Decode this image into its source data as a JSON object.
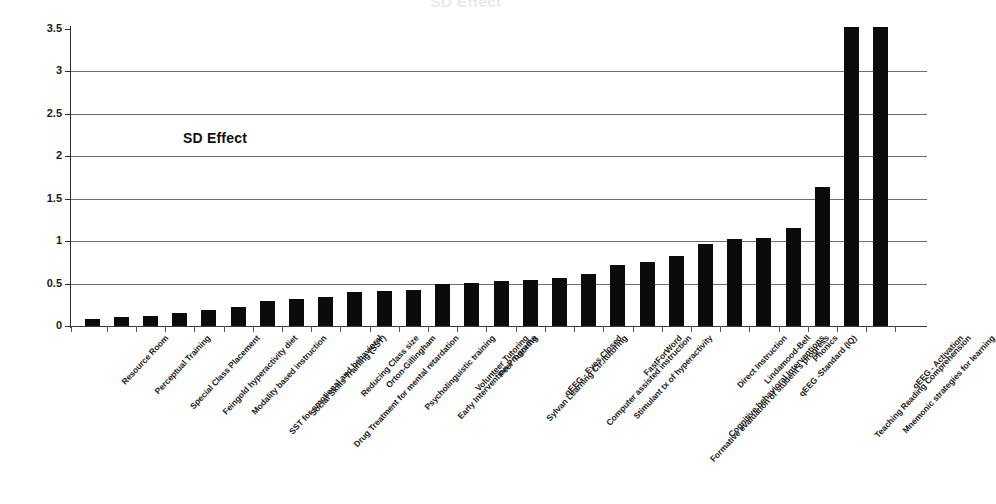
{
  "chart_data": {
    "type": "bar",
    "title": "SD Effect",
    "annotation": "SD Effect",
    "xlabel": "",
    "ylabel": "",
    "ylim": [
      0,
      3.5
    ],
    "ytick_step": 0.5,
    "ytick_labels": [
      "3.5",
      "3",
      "2.5",
      "2",
      "1.5",
      "1",
      "0.5",
      "0"
    ],
    "ytick_values": [
      3.5,
      3,
      2.5,
      2,
      1.5,
      1,
      0.5,
      0
    ],
    "grid": true,
    "legend": "none",
    "bar_color": "#0b0b0b",
    "categories": [
      "Resource Room",
      "Perceptual Training",
      "Special Class Placement",
      "Feingold hyperactivity diet",
      "Modality based instruction",
      "SST for emotional and behavioral",
      "Social Skills Training (SST)",
      "Drug Treatment for mental retardation",
      "Reducing Class size",
      "Orton-Gillingham",
      "Psycholinguistic training",
      "Early Intervention Programs",
      "Volunteer Tutoring",
      "Peer Tutoring",
      "Sylvan Learning Ctr./tutoring",
      "qEEG - Eyes Closed",
      "Computer assisted instruction",
      "Stimulant tx of hyperactivity",
      "FastForWord",
      "Formative evaluation of student's progress",
      "Cognitive behavioral Interventions",
      "Direct Instruction",
      "Lindamood-Bell",
      "qEEG -Standard (IQ)",
      "Phonics",
      "Teaching Reading Comprehension",
      "Mnemonic strategies for learning",
      "qEEG - Activation"
    ],
    "values": [
      0.08,
      0.11,
      0.12,
      0.15,
      0.19,
      0.22,
      0.3,
      0.32,
      0.34,
      0.4,
      0.41,
      0.42,
      0.5,
      0.51,
      0.53,
      0.54,
      0.57,
      0.61,
      0.72,
      0.76,
      0.83,
      0.97,
      1.02,
      1.04,
      1.15,
      1.64,
      3.52,
      3.52
    ]
  }
}
